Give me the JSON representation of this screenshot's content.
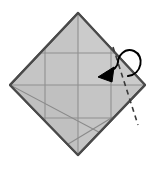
{
  "diagram": {
    "type": "origami-fold-instruction",
    "canvas": {
      "width": 153,
      "height": 169,
      "background": "#ffffff"
    },
    "colors": {
      "paper_fill": "#c5c5c5",
      "paper_fill_light": "#cfcfcf",
      "paper_outline": "#4a4a4a",
      "crease_line": "#8f8f8f",
      "fold_line_dashed": "#3a3a3a",
      "arrow_stroke": "#000000",
      "arrow_head_fill": "#000000"
    },
    "shape": {
      "name": "diamond",
      "description": "square rotated 45 degrees",
      "vertices": [
        {
          "label": "top",
          "x": 78,
          "y": 13
        },
        {
          "label": "right",
          "x": 145,
          "y": 85
        },
        {
          "label": "bottom",
          "x": 78,
          "y": 155
        },
        {
          "label": "left",
          "x": 10,
          "y": 85
        }
      ]
    },
    "creases": {
      "horizontal": [
        {
          "label": "upper-horizontal-crease",
          "y": 53
        },
        {
          "label": "center-horizontal-crease",
          "y": 85
        },
        {
          "label": "lower-horizontal-crease",
          "y": 118
        }
      ],
      "vertical": [
        {
          "label": "left-vertical-crease",
          "x": 45
        },
        {
          "label": "center-vertical-crease",
          "x": 78
        },
        {
          "label": "right-vertical-crease",
          "x": 111
        }
      ],
      "diagonals": [
        {
          "label": "bottom-left-fold",
          "x1": 10,
          "y1": 85,
          "x2": 120,
          "y2": 143
        },
        {
          "label": "bottom-right-fold",
          "x1": 111,
          "y1": 118,
          "x2": 60,
          "y2": 150
        }
      ]
    },
    "fold_line": {
      "label": "valley-fold-dashed-line",
      "style": "dashed",
      "x1": 113,
      "y1": 47,
      "x2": 138,
      "y2": 125
    },
    "arrow": {
      "label": "fold-direction-arrow",
      "style": "curved-loop",
      "direction": "right-to-left",
      "head_tip": {
        "x": 99,
        "y": 76
      },
      "loop_apex": {
        "x": 134,
        "y": 52
      }
    }
  }
}
